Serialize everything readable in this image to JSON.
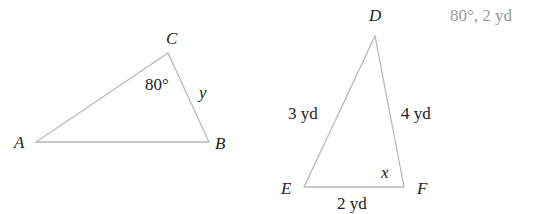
{
  "triangle_abc": {
    "vertices": {
      "A": "A",
      "B": "B",
      "C": "C"
    },
    "angle_c": "80°",
    "side_cb": "y"
  },
  "triangle_def": {
    "vertices": {
      "D": "D",
      "E": "E",
      "F": "F"
    },
    "side_de": "3 yd",
    "side_df": "4 yd",
    "side_ef": "2 yd",
    "angle_f": "x"
  },
  "overlay_text": "80°, 2 yd",
  "colors": {
    "line": "#b8b8b8",
    "text": "#222222",
    "faint_text": "#9a9a9a"
  }
}
